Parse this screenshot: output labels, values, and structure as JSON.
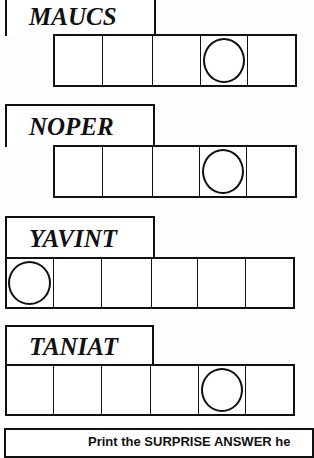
{
  "puzzle": {
    "words": [
      {
        "scrambled": "MAUCS",
        "cells": 5,
        "circled": [
          3
        ],
        "label_box": {
          "x": 5,
          "y": -4,
          "w": 150,
          "h": 40
        },
        "cells_box": {
          "x": 53,
          "y": 35,
          "cell_w": 48.6,
          "h": 51
        }
      },
      {
        "scrambled": "NOPER",
        "cells": 5,
        "circled": [
          3
        ],
        "label_box": {
          "x": 5,
          "y": 104,
          "w": 150,
          "h": 43
        },
        "cells_box": {
          "x": 53,
          "y": 146,
          "cell_w": 48.6,
          "h": 51
        }
      },
      {
        "scrambled": "YAVINT",
        "cells": 6,
        "circled": [
          0
        ],
        "label_box": {
          "x": 5,
          "y": 216,
          "w": 150,
          "h": 43
        },
        "cells_box": {
          "x": 5,
          "y": 258,
          "cell_w": 48.2,
          "h": 50
        }
      },
      {
        "scrambled": "TANIAT",
        "cells": 6,
        "circled": [
          4
        ],
        "label_box": {
          "x": 5,
          "y": 325,
          "w": 149,
          "h": 41
        },
        "cells_box": {
          "x": 5,
          "y": 365,
          "cell_w": 48,
          "h": 50
        }
      }
    ],
    "answer_instruction": "Print the SURPRISE ANSWER he"
  },
  "colors": {
    "ink": "#111111",
    "paper": "#fdfdfb"
  }
}
